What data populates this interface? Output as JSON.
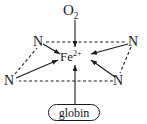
{
  "diagram": {
    "background_color": "#ffffff",
    "stroke_color": "#1a1a1a",
    "nodes": {
      "oxygen": {
        "name": "O2",
        "text": "O",
        "subscript": "2"
      },
      "iron": {
        "name": "Fe2+",
        "text": "Fe",
        "superscript": "2+"
      },
      "nitrogen_top_left": {
        "text": "N"
      },
      "nitrogen_top_right": {
        "text": "N"
      },
      "nitrogen_bottom_left": {
        "text": "N"
      },
      "nitrogen_bottom_right": {
        "text": "N"
      },
      "globin": {
        "text": "globin"
      }
    },
    "edges": [
      {
        "from": "O2",
        "to": "Fe2+",
        "style": "solid",
        "arrow": "to"
      },
      {
        "from": "globin",
        "to": "Fe2+",
        "style": "solid",
        "arrow": "to"
      },
      {
        "from": "N-top-left",
        "to": "Fe2+",
        "style": "solid",
        "arrow": "to"
      },
      {
        "from": "N-top-right",
        "to": "Fe2+",
        "style": "solid",
        "arrow": "to"
      },
      {
        "from": "N-bottom-left",
        "to": "Fe2+",
        "style": "solid",
        "arrow": "to"
      },
      {
        "from": "N-bottom-right",
        "to": "Fe2+",
        "style": "solid",
        "arrow": "to"
      },
      {
        "from": "N-top-left",
        "to": "N-top-right",
        "style": "dashed",
        "arrow": "none"
      },
      {
        "from": "N-top-right",
        "to": "N-bottom-right",
        "style": "dashed",
        "arrow": "none"
      },
      {
        "from": "N-bottom-right",
        "to": "N-bottom-left",
        "style": "dashed",
        "arrow": "none"
      },
      {
        "from": "N-bottom-left",
        "to": "N-top-left",
        "style": "dashed",
        "arrow": "none"
      }
    ]
  }
}
